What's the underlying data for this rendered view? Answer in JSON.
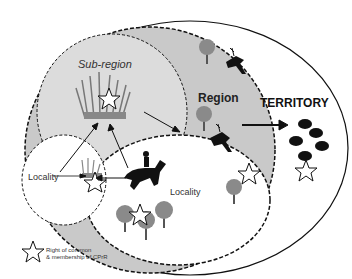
{
  "diagram": {
    "labels": {
      "sub_region": "Sub-region",
      "region": "Region",
      "territory": "TERRITORY",
      "locality_left": "Locality",
      "locality_bottom": "Locality"
    },
    "legend": {
      "icon": "star-outline-icon",
      "line1": "Right of common",
      "line2": "& membership of CPrR"
    },
    "icons": [
      "grass-icon",
      "tree-icon",
      "deer-icon",
      "horse-rider-icon",
      "sheep-icon",
      "star-icon"
    ],
    "colors": {
      "region_fill": "#c9c9c9",
      "subregion_fill": "#dcdcdc",
      "locality_fill": "#ffffff",
      "outline": "#111111",
      "tree_crown": "#8a8a8a",
      "animal": "#111111"
    }
  }
}
